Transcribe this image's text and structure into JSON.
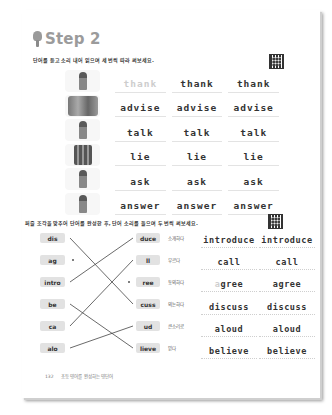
{
  "header": {
    "title": "Step 2",
    "icon": "lightbulb-icon"
  },
  "section1": {
    "instruction": "단어를 듣고 소리 내어 읽으며 세 번씩 따라 써보세요.",
    "qr_icon": "qr-code-icon",
    "rows": [
      {
        "picture": "woman-thanking",
        "word": "thank",
        "cells": [
          "thank",
          "thank",
          "thank"
        ],
        "first_traced": true
      },
      {
        "picture": "people-advising",
        "word": "advise",
        "cells": [
          "advise",
          "advise",
          "advise"
        ],
        "first_traced": false
      },
      {
        "picture": "man-talking-phone",
        "word": "talk",
        "cells": [
          "talk",
          "talk",
          "talk"
        ],
        "first_traced": false
      },
      {
        "picture": "group-lying",
        "word": "lie",
        "cells": [
          "lie",
          "lie",
          "lie"
        ],
        "first_traced": false
      },
      {
        "picture": "boy-asking",
        "word": "ask",
        "cells": [
          "ask",
          "ask",
          "ask"
        ],
        "first_traced": false
      },
      {
        "picture": "girl-answering",
        "word": "answer",
        "cells": [
          "answer",
          "answer",
          "answer"
        ],
        "first_traced": false
      }
    ]
  },
  "section2": {
    "instruction": "퍼즐 조각을 맞추어 단어를 완성한 후, 단어 소리를 들으며 두 번씩 써보세요.",
    "qr_icon": "qr-code-icon",
    "left_pieces": [
      "dis",
      "ag",
      "intro",
      "be",
      "ca",
      "alo"
    ],
    "right_pieces": [
      "duce",
      "ll",
      "ree",
      "cuss",
      "ud",
      "lieve"
    ],
    "meanings": [
      "소개하다",
      "부르다",
      "동의하다",
      "의논하다",
      "큰소리로",
      "믿다"
    ],
    "connections": [
      {
        "from": "dis",
        "to": "cuss"
      },
      {
        "from": "intro",
        "to": "duce"
      },
      {
        "from": "ca",
        "to": "ll"
      },
      {
        "from": "be",
        "to": "lieve"
      },
      {
        "from": "alo",
        "to": "ud"
      },
      {
        "from": "ag",
        "to": "ree",
        "drawn": false
      }
    ],
    "write_rows": [
      {
        "cells": [
          "introduce",
          "introduce"
        ]
      },
      {
        "cells": [
          "call",
          "call"
        ]
      },
      {
        "cells_faint_prefix": "a",
        "first_rest": "gree",
        "second": "agree"
      },
      {
        "cells": [
          "discuss",
          "discuss"
        ]
      },
      {
        "cells": [
          "aloud",
          "aloud"
        ]
      },
      {
        "cells": [
          "believe",
          "believe"
        ]
      }
    ]
  },
  "footer": {
    "page_number": "132",
    "text": "초등 영어를 완성하는 영단어"
  }
}
